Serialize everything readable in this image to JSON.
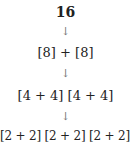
{
  "root": "16",
  "arrow": "↓",
  "levels": [
    "[8] + [8]",
    "[4 + 4] [4 + 4]",
    "[2 + 2] [2 + 2] [2 + 2] [2 + 2]"
  ]
}
